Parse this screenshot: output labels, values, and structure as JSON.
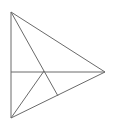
{
  "figure": {
    "title": "Geometric line figure",
    "width": 121,
    "height": 126,
    "background_color": "#ffffff",
    "stroke_color": "#6a6a6a",
    "stroke_width": 1,
    "points": {
      "top_left": {
        "label": "A",
        "x": 11,
        "y": 12
      },
      "bottom_left": {
        "label": "B",
        "x": 11,
        "y": 118
      },
      "right_apex": {
        "label": "C",
        "x": 105,
        "y": 72
      },
      "center_cross": {
        "label": "D",
        "x": 44,
        "y": 71
      },
      "lower_node": {
        "label": "E",
        "x": 58,
        "y": 96
      }
    },
    "segments": [
      {
        "name": "left-vertical-edge",
        "from": "top_left",
        "to": "bottom_left",
        "x1": 11,
        "y1": 12,
        "x2": 11,
        "y2": 118
      },
      {
        "name": "upper-diagonal-edge",
        "from": "top_left",
        "to": "right_apex",
        "x1": 11,
        "y1": 12,
        "x2": 105,
        "y2": 72
      },
      {
        "name": "lower-diagonal-edge",
        "from": "bottom_left",
        "to": "right_apex",
        "x1": 11,
        "y1": 118,
        "x2": 105,
        "y2": 72
      },
      {
        "name": "horizontal-median",
        "from": "left-midpoint",
        "to": "right_apex",
        "x1": 11,
        "y1": 72,
        "x2": 105,
        "y2": 72
      },
      {
        "name": "cevian-top-to-bottom-left",
        "from": "top_left",
        "to": "bottom_left",
        "x1": 11,
        "y1": 12,
        "x2": 11,
        "y2": 118,
        "via_x": 44,
        "via_y": 71
      },
      {
        "name": "cevian-cross-to-lower-node",
        "from": "center_cross",
        "to": "lower_node",
        "x1": 44,
        "y1": 71,
        "x2": 58,
        "y2": 96
      }
    ]
  }
}
